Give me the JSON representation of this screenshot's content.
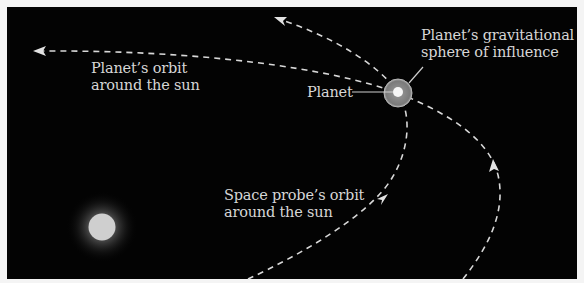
{
  "diagram": {
    "background_color": "#030303",
    "line_color": "#d8d8d8",
    "labels": {
      "planet_orbit": {
        "line1": "Planet’s orbit",
        "line2": "around the sun"
      },
      "gravitational_sphere": {
        "line1": "Planet’s gravitational",
        "line2": "sphere of influence"
      },
      "planet": {
        "text": "Planet"
      },
      "probe_orbit": {
        "line1": "Space probe’s orbit",
        "line2": "around the sun"
      }
    },
    "objects": {
      "sun": {
        "name": "Sun",
        "color": "#cfcfcf"
      },
      "planet": {
        "name": "Planet",
        "color": "#f4f4f4"
      },
      "sphere_of_influence": {
        "name": "Gravitational sphere of influence",
        "color": "#8a8a8a"
      }
    }
  }
}
